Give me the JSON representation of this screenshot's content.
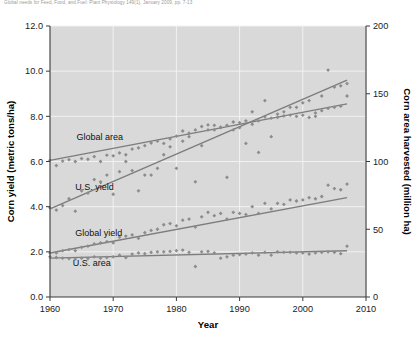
{
  "caption": {
    "text": "Global needs for Feed, Food, and Fuel: Plant Physiology 149(1), January 2009, pp. 7-13"
  },
  "chart_data": {
    "type": "scatter",
    "title": "",
    "xlabel": "Year",
    "ylabel": "Corn yield (metric tons/ha)",
    "y2label": "Corn area harvested (million ha)",
    "xlim": [
      1960,
      2010
    ],
    "ylim": [
      0.0,
      12.0
    ],
    "y2lim": [
      0,
      200
    ],
    "xticks": [
      "1960",
      "1970",
      "1980",
      "1990",
      "2000",
      "2010"
    ],
    "yticks": [
      "0.0",
      "2.0",
      "4.0",
      "6.0",
      "8.0",
      "10.0",
      "12.0"
    ],
    "y2ticks": [
      "0",
      "50",
      "100",
      "150",
      "200"
    ],
    "grid": true,
    "legend_position": "inline-annotations",
    "marker_color": "#8c8c8c",
    "trendline_color": "#7d7d7d",
    "plot_background": "#d9d9d9",
    "series": [
      {
        "name": "Global area",
        "axis": "right",
        "units": "million ha",
        "label_x": 1964.2,
        "label_y": 6.95,
        "trend_start": [
          1960,
          6.05
        ],
        "trend_end": [
          2007,
          8.55
        ],
        "x": [
          1960,
          1961,
          1962,
          1963,
          1964,
          1965,
          1966,
          1967,
          1968,
          1969,
          1970,
          1971,
          1972,
          1973,
          1974,
          1975,
          1976,
          1977,
          1978,
          1979,
          1980,
          1981,
          1982,
          1983,
          1984,
          1985,
          1986,
          1987,
          1988,
          1989,
          1990,
          1991,
          1992,
          1993,
          1994,
          1995,
          1996,
          1997,
          1998,
          1999,
          2000,
          2001,
          2002,
          2003,
          2004,
          2005,
          2006,
          2007
        ],
        "values": [
          6.05,
          5.82,
          6.02,
          6.08,
          6.0,
          6.13,
          6.1,
          6.22,
          6.0,
          6.28,
          6.25,
          6.38,
          6.3,
          6.55,
          6.6,
          6.7,
          6.82,
          6.9,
          6.8,
          7.0,
          7.12,
          7.35,
          7.25,
          7.4,
          7.55,
          7.62,
          7.6,
          7.52,
          7.6,
          7.75,
          7.72,
          7.8,
          7.65,
          7.8,
          7.98,
          7.92,
          8.1,
          8.02,
          8.05,
          8.0,
          8.05,
          7.95,
          8.0,
          8.25,
          8.35,
          8.4,
          8.45,
          8.9
        ]
      },
      {
        "name": "U.S. yield",
        "axis": "left",
        "units": "metric tons/ha",
        "label_x": 1964.0,
        "label_y": 4.75,
        "trend_start": [
          1960,
          3.9
        ],
        "trend_end": [
          2007,
          9.6
        ],
        "x": [
          1960,
          1961,
          1962,
          1963,
          1964,
          1965,
          1966,
          1967,
          1968,
          1969,
          1970,
          1971,
          1972,
          1973,
          1974,
          1975,
          1976,
          1977,
          1978,
          1979,
          1980,
          1981,
          1982,
          1983,
          1984,
          1985,
          1986,
          1987,
          1988,
          1989,
          1990,
          1991,
          1992,
          1993,
          1994,
          1995,
          1996,
          1997,
          1998,
          1999,
          2000,
          2001,
          2002,
          2003,
          2004,
          2005,
          2006,
          2007
        ],
        "values": [
          3.95,
          3.85,
          4.05,
          4.35,
          3.8,
          4.7,
          4.6,
          5.2,
          5.1,
          5.4,
          4.55,
          5.55,
          6.0,
          5.6,
          4.7,
          5.4,
          5.4,
          5.7,
          6.3,
          6.65,
          5.7,
          6.9,
          7.1,
          5.1,
          6.7,
          7.4,
          7.4,
          7.5,
          5.3,
          7.4,
          7.5,
          6.8,
          8.2,
          6.4,
          8.7,
          7.1,
          7.95,
          8.2,
          8.4,
          8.4,
          8.6,
          8.7,
          8.15,
          8.9,
          10.05,
          9.3,
          9.35,
          9.45
        ]
      },
      {
        "name": "Global yield",
        "axis": "left",
        "units": "metric tons/ha",
        "label_x": 1964.0,
        "label_y": 2.72,
        "trend_start": [
          1960,
          1.95
        ],
        "trend_end": [
          2007,
          4.4
        ],
        "x": [
          1960,
          1961,
          1962,
          1963,
          1964,
          1965,
          1966,
          1967,
          1968,
          1969,
          1970,
          1971,
          1972,
          1973,
          1974,
          1975,
          1976,
          1977,
          1978,
          1979,
          1980,
          1981,
          1982,
          1983,
          1984,
          1985,
          1986,
          1987,
          1988,
          1989,
          1990,
          1991,
          1992,
          1993,
          1994,
          1995,
          1996,
          1997,
          1998,
          1999,
          2000,
          2001,
          2002,
          2003,
          2004,
          2005,
          2006,
          2007
        ],
        "values": [
          1.95,
          1.95,
          2.05,
          2.1,
          2.05,
          2.2,
          2.25,
          2.35,
          2.4,
          2.45,
          2.4,
          2.65,
          2.7,
          2.75,
          2.6,
          2.85,
          2.95,
          3.0,
          3.2,
          3.25,
          3.15,
          3.4,
          3.45,
          3.1,
          3.55,
          3.75,
          3.6,
          3.7,
          3.45,
          3.75,
          3.7,
          3.65,
          4.0,
          3.7,
          4.15,
          3.9,
          4.15,
          4.1,
          4.3,
          4.25,
          4.3,
          4.4,
          4.35,
          4.45,
          4.95,
          4.8,
          4.75,
          5.0
        ]
      },
      {
        "name": "U.S. area",
        "axis": "right",
        "units": "million ha",
        "label_x": 1963.6,
        "label_y": 1.38,
        "trend_start": [
          1960,
          1.72
        ],
        "trend_end": [
          2007,
          2.05
        ],
        "x": [
          1960,
          1961,
          1962,
          1963,
          1964,
          1965,
          1966,
          1967,
          1968,
          1969,
          1970,
          1971,
          1972,
          1973,
          1974,
          1975,
          1976,
          1977,
          1978,
          1979,
          1980,
          1981,
          1982,
          1983,
          1984,
          1985,
          1986,
          1987,
          1988,
          1989,
          1990,
          1991,
          1992,
          1993,
          1994,
          1995,
          1996,
          1997,
          1998,
          1999,
          2000,
          2001,
          2002,
          2003,
          2004,
          2005,
          2006,
          2007
        ],
        "values": [
          1.78,
          1.75,
          1.72,
          1.7,
          1.68,
          1.72,
          1.7,
          1.78,
          1.72,
          1.75,
          1.78,
          1.85,
          1.75,
          1.9,
          1.95,
          1.92,
          1.98,
          2.0,
          2.0,
          2.02,
          2.05,
          2.08,
          1.98,
          1.35,
          2.0,
          2.02,
          1.95,
          1.72,
          1.78,
          1.85,
          1.88,
          1.9,
          1.95,
          1.85,
          1.98,
          1.85,
          2.0,
          1.98,
          1.98,
          1.95,
          1.95,
          1.9,
          1.95,
          1.98,
          2.0,
          1.98,
          1.92,
          2.25
        ]
      }
    ]
  }
}
